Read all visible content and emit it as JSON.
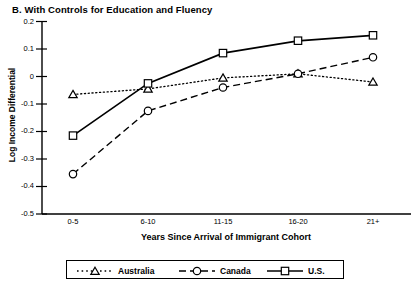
{
  "panel": {
    "title": "B.  With Controls for Education and Fluency"
  },
  "axes": {
    "ylabel": "Log Income Differential",
    "xlabel": "Years Since Arrival of Immigrant Cohort",
    "yticks": [
      "0.2",
      "0.1",
      "0",
      "-0.1",
      "-0.2",
      "-0.3",
      "-0.4",
      "-0.5"
    ],
    "xticks": [
      "0-5",
      "6-10",
      "11-15",
      "16-20",
      "21+"
    ]
  },
  "legend": {
    "items": [
      {
        "label": "Australia",
        "marker": "triangle",
        "line": "dotted"
      },
      {
        "label": "Canada",
        "marker": "circle",
        "line": "dashed"
      },
      {
        "label": "U.S.",
        "marker": "square",
        "line": "solid"
      }
    ]
  },
  "chart_data": {
    "type": "line",
    "title": "B.  With Controls for Education and Fluency",
    "xlabel": "Years Since Arrival of Immigrant Cohort",
    "ylabel": "Log Income Differential",
    "categories": [
      "0-5",
      "6-10",
      "11-15",
      "16-20",
      "21+"
    ],
    "ylim": [
      -0.5,
      0.2
    ],
    "ytick_values": [
      0.2,
      0.1,
      0.0,
      -0.1,
      -0.2,
      -0.3,
      -0.4,
      -0.5
    ],
    "grid": false,
    "legend_position": "bottom",
    "series": [
      {
        "name": "Australia",
        "marker": "triangle",
        "line": "dotted",
        "color": "#000000",
        "values": [
          -0.065,
          -0.045,
          -0.005,
          0.01,
          -0.02
        ]
      },
      {
        "name": "Canada",
        "marker": "circle",
        "line": "dashed",
        "color": "#000000",
        "values": [
          -0.355,
          -0.125,
          -0.04,
          0.01,
          0.07
        ]
      },
      {
        "name": "U.S.",
        "marker": "square",
        "line": "solid",
        "color": "#000000",
        "values": [
          -0.215,
          -0.025,
          0.085,
          0.13,
          0.15
        ]
      }
    ]
  }
}
